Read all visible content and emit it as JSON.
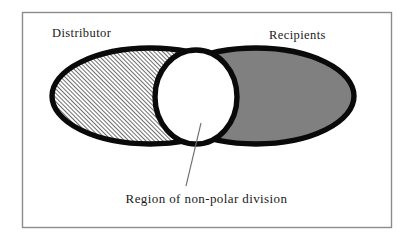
{
  "figure": {
    "type": "venn-diagram",
    "background_color": "#ffffff",
    "frame": {
      "border_color": "#808080",
      "x": 22,
      "y": 12,
      "width": 370,
      "height": 216
    },
    "labels": {
      "left_set": "Distributor",
      "right_set": "Recipients",
      "caption": "Region of non-polar division"
    },
    "shapes": {
      "left_ellipse": {
        "name": "Distributor",
        "fill": "diagonal-hatch",
        "hatch_color": "#4d4d4d",
        "hatch_background": "#ffffff",
        "stroke_color": "#000000",
        "cx": 150,
        "cy": 96,
        "rx": 98,
        "ry": 48
      },
      "right_ellipse": {
        "name": "Recipients",
        "fill": "solid",
        "fill_color": "#808080",
        "stroke_color": "#000000",
        "cx": 256,
        "cy": 96,
        "rx": 98,
        "ry": 48
      },
      "center_circle": {
        "name": "Region of non-polar division",
        "fill": "solid",
        "fill_color": "#ffffff",
        "stroke_color": "#000000",
        "cx": 196,
        "cy": 97,
        "rx": 41,
        "ry": 47
      },
      "leader_line": {
        "stroke_color": "#707070",
        "x1": 201,
        "y1": 123,
        "x2": 186,
        "y2": 186
      }
    }
  }
}
